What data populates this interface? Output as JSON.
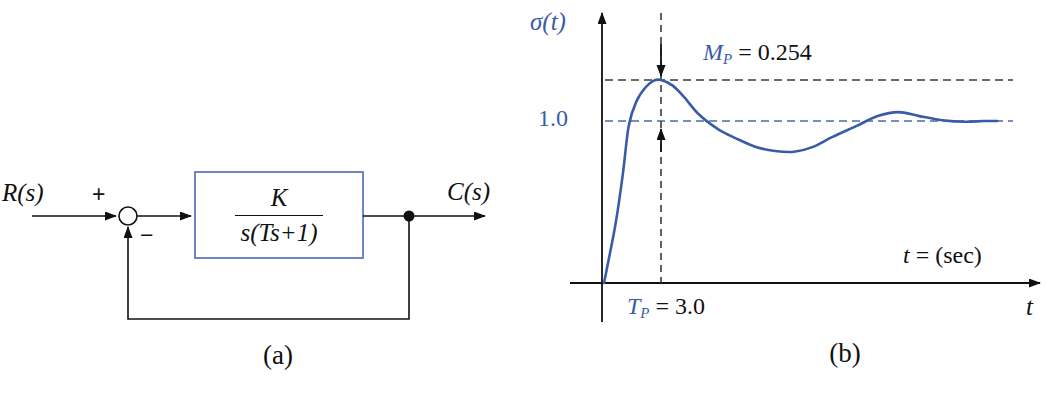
{
  "figure": {
    "panel_a": {
      "caption": "(a)",
      "input_label": "R(s)",
      "output_label": "C(s)",
      "plus_sign": "+",
      "minus_sign": "−",
      "block": {
        "numerator": "K",
        "denominator": "s(Ts+1)"
      }
    },
    "panel_b": {
      "caption": "(b)",
      "y_axis_label": "σ(t)",
      "unity_label": "1.0",
      "overshoot": {
        "var": "M",
        "sub": "P",
        "rest": " = 0.254"
      },
      "peak_time": {
        "var": "T",
        "sub": "P",
        "rest": " = 3.0"
      },
      "time_units": {
        "var": "t",
        "rest": " = (sec)"
      },
      "x_axis_label": "t"
    }
  },
  "colors": {
    "label_blue": "#3a5ca8",
    "curve_blue": "#3a5ca8",
    "block_border_blue": "#5f7abc",
    "unity_dash_blue": "#4a69ac",
    "line_black": "#111111",
    "dash_gray": "#3a3a3a"
  },
  "chart_data": {
    "type": "line",
    "ylabel": "σ(t)",
    "xlabel": "t = (sec)",
    "grid": false,
    "xlim": [
      0,
      23
    ],
    "ylim": [
      0,
      1.45
    ],
    "series": [
      {
        "name": "unit-step-response",
        "x": [
          0,
          0.6,
          1.0,
          1.3,
          1.7,
          2.2,
          2.6,
          3.0,
          3.6,
          4.2,
          5.0,
          6.0,
          7.0,
          8.0,
          9.0,
          10.0,
          11.0,
          12.0,
          13.3,
          14.4,
          15.5,
          16.6,
          17.8,
          19.0,
          20.0,
          20.7
        ],
        "y": [
          0,
          0.36,
          0.68,
          0.97,
          1.12,
          1.21,
          1.248,
          1.254,
          1.22,
          1.15,
          1.04,
          0.95,
          0.89,
          0.84,
          0.815,
          0.81,
          0.84,
          0.9,
          0.97,
          1.03,
          1.055,
          1.03,
          1.005,
          0.995,
          1.0,
          1.0
        ]
      }
    ],
    "reference_lines": [
      {
        "label": "M_P = 0.254",
        "y": 1.254
      },
      {
        "label": "1.0",
        "y": 1.0
      },
      {
        "label": "T_P = 3.0",
        "x": 3.0
      }
    ],
    "annotations": {
      "peak_value": 1.254,
      "peak_time": 3.0,
      "steady_state": 1.0
    }
  }
}
